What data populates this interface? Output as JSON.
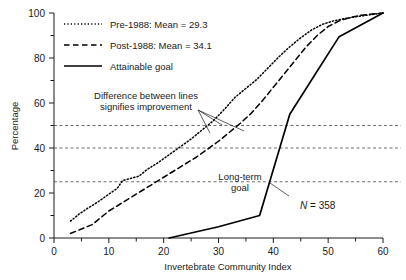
{
  "chart_data": {
    "type": "line",
    "title": "",
    "xlabel": "Invertebrate Community Index",
    "ylabel": "Percentage",
    "xlim": [
      0,
      60
    ],
    "ylim": [
      0,
      100
    ],
    "xticks": [
      0,
      10,
      20,
      30,
      40,
      50,
      60
    ],
    "xminorticks": [
      5,
      15,
      25,
      35,
      45,
      55
    ],
    "yticks": [
      0,
      20,
      40,
      60,
      80,
      100
    ],
    "yminorticks": [
      10,
      30,
      50,
      70,
      90
    ],
    "grid": false,
    "legend_position": "top-left",
    "series": [
      {
        "name": "Pre-1988: Mean = 29.3",
        "style": "dotted",
        "color": "#000000",
        "points": [
          [
            3.0,
            7.5
          ],
          [
            4.5,
            10.5
          ],
          [
            6.0,
            13.0
          ],
          [
            8.0,
            16.0
          ],
          [
            10.0,
            19.5
          ],
          [
            11.5,
            22.0
          ],
          [
            12.5,
            25.5
          ],
          [
            14.0,
            26.5
          ],
          [
            15.5,
            27.5
          ],
          [
            17.0,
            30.5
          ],
          [
            19.0,
            33.5
          ],
          [
            21.0,
            37.0
          ],
          [
            23.0,
            40.5
          ],
          [
            25.0,
            44.0
          ],
          [
            27.0,
            48.0
          ],
          [
            29.0,
            52.0
          ],
          [
            31.0,
            57.0
          ],
          [
            33.0,
            62.5
          ],
          [
            35.0,
            66.5
          ],
          [
            37.0,
            70.5
          ],
          [
            39.0,
            75.5
          ],
          [
            41.0,
            80.5
          ],
          [
            43.0,
            85.0
          ],
          [
            45.0,
            89.0
          ],
          [
            47.0,
            92.5
          ],
          [
            49.0,
            95.0
          ],
          [
            51.0,
            96.5
          ],
          [
            53.0,
            97.5
          ],
          [
            55.0,
            98.3
          ],
          [
            57.0,
            99.0
          ],
          [
            60.0,
            100.0
          ]
        ]
      },
      {
        "name": "Post-1988: Mean = 34.1",
        "style": "dashed",
        "color": "#000000",
        "points": [
          [
            3.0,
            2.0
          ],
          [
            5.0,
            4.0
          ],
          [
            7.0,
            6.0
          ],
          [
            8.5,
            9.0
          ],
          [
            10.0,
            12.0
          ],
          [
            12.0,
            15.0
          ],
          [
            14.0,
            18.0
          ],
          [
            16.0,
            21.0
          ],
          [
            18.0,
            24.0
          ],
          [
            20.0,
            27.0
          ],
          [
            22.0,
            30.0
          ],
          [
            24.0,
            33.0
          ],
          [
            26.0,
            36.0
          ],
          [
            28.0,
            39.5
          ],
          [
            30.0,
            43.0
          ],
          [
            32.0,
            47.0
          ],
          [
            34.0,
            51.0
          ],
          [
            36.0,
            55.5
          ],
          [
            38.0,
            61.0
          ],
          [
            40.0,
            67.0
          ],
          [
            42.0,
            73.0
          ],
          [
            44.0,
            79.0
          ],
          [
            46.0,
            85.0
          ],
          [
            48.0,
            90.0
          ],
          [
            50.0,
            94.0
          ],
          [
            52.0,
            96.5
          ],
          [
            54.0,
            98.0
          ],
          [
            56.0,
            99.0
          ],
          [
            60.0,
            100.0
          ]
        ]
      },
      {
        "name": "Attainable goal",
        "style": "solid",
        "color": "#000000",
        "points": [
          [
            21.0,
            0.0
          ],
          [
            30.0,
            5.0
          ],
          [
            37.5,
            10.0
          ],
          [
            43.0,
            55.0
          ],
          [
            52.0,
            89.5
          ],
          [
            60.0,
            100.0
          ]
        ]
      }
    ],
    "reference_lines": [
      {
        "value": 50,
        "style": "dashed",
        "label": ""
      },
      {
        "value": 40,
        "style": "dashed",
        "label": ""
      },
      {
        "value": 25,
        "style": "dashed",
        "label": ""
      }
    ],
    "annotations": [
      {
        "name": "difference-annotation",
        "lines": [
          "Difference between lines",
          "signifies improvement"
        ],
        "x": 145,
        "y": 95
      },
      {
        "name": "long-term-goal-annotation",
        "lines": [
          "Long-term",
          "goal"
        ],
        "x": 248,
        "y": 178
      },
      {
        "name": "sample-size-annotation",
        "symbol": "N",
        "text": " = 358",
        "full": "N = 358",
        "x": 300,
        "y": 207
      }
    ]
  },
  "legend": {
    "items": [
      {
        "label": "Pre-1988: Mean = 29.3",
        "style": "dotted"
      },
      {
        "label": "Post-1988: Mean = 34.1",
        "style": "dashed"
      },
      {
        "label": "Attainable goal",
        "style": "solid"
      }
    ]
  },
  "axes": {
    "x_title": "Invertebrate Community Index",
    "y_title": "Percentage",
    "x_tick_labels": [
      "0",
      "10",
      "20",
      "30",
      "40",
      "50",
      "60"
    ],
    "y_tick_labels": [
      "0",
      "20",
      "40",
      "60",
      "80",
      "100"
    ]
  }
}
